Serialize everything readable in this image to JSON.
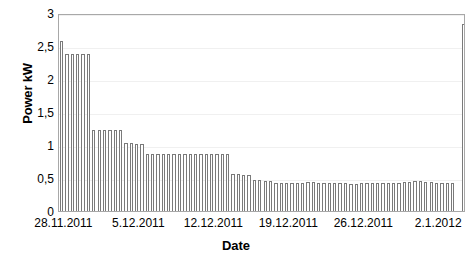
{
  "chart_data": {
    "type": "bar",
    "title": "",
    "xlabel": "Date",
    "ylabel": "Power kW",
    "ylim": [
      0,
      3
    ],
    "xlim_labels": [
      "28.11.2011",
      "5.12.2011",
      "12.12.2011",
      "19.12.2011",
      "26.12.2011",
      "2.1.2012"
    ],
    "ytick_labels": [
      "0",
      "0,5",
      "1",
      "1,5",
      "2",
      "2,5",
      "3"
    ],
    "ytick_values": [
      0,
      0.5,
      1,
      1.5,
      2,
      2.5,
      3
    ],
    "grid": "horizontal-faint",
    "legend": "none",
    "bar_color": "#ffffff",
    "bar_edge_color": "#7a7a7a",
    "axis_color": "#a8a8a8",
    "x_axis_start_date": "28.11.2011",
    "x_axis_end_date": "4.1.2012",
    "x_tick_interval_days": 7,
    "categories": [
      "28.11.2011",
      "29.11.2011",
      "30.11.2011",
      "1.12.2011",
      "2.12.2011",
      "3.12.2011",
      "4.12.2011",
      "5.12.2011",
      "6.12.2011",
      "7.12.2011",
      "8.12.2011",
      "9.12.2011",
      "10.12.2011",
      "11.12.2011",
      "12.12.2011",
      "13.12.2011",
      "14.12.2011",
      "15.12.2011",
      "16.12.2011",
      "17.12.2011",
      "18.12.2011",
      "19.12.2011",
      "20.12.2011",
      "21.12.2011",
      "22.12.2011",
      "23.12.2011",
      "24.12.2011",
      "25.12.2011",
      "26.12.2011",
      "27.12.2011",
      "28.12.2011",
      "29.12.2011",
      "30.12.2011",
      "31.12.2011",
      "1.1.2012",
      "2.1.2012",
      "3.1.2012",
      "4.1.2012"
    ],
    "values": [
      2.57,
      2.38,
      2.38,
      1.22,
      1.22,
      1.22,
      1.03,
      1.02,
      0.86,
      0.86,
      0.86,
      0.86,
      0.86,
      0.86,
      0.86,
      0.86,
      0.56,
      0.55,
      0.47,
      0.46,
      0.42,
      0.42,
      0.42,
      0.44,
      0.43,
      0.42,
      0.42,
      0.41,
      0.42,
      0.42,
      0.42,
      0.43,
      0.44,
      0.45,
      0.44,
      0.43,
      0.42,
      2.83
    ],
    "series_note": "Daily power demand decaying from initial peak, flat plateau near 0,42 kW, final spike"
  }
}
